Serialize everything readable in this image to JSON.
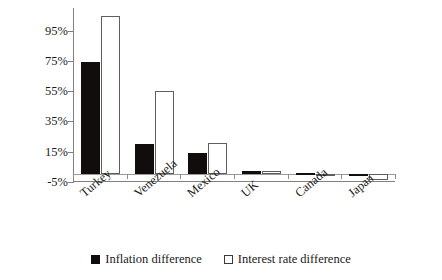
{
  "chart_data": {
    "type": "bar",
    "title": "",
    "subtitle": "",
    "xlabel": "",
    "ylabel": "",
    "categories": [
      "Turkey",
      "Venezuela",
      "Mexico",
      "UK",
      "Canada",
      "Japan"
    ],
    "series": [
      {
        "name": "Inflation difference",
        "swatch": "filled-black-square",
        "color": "#120d0d",
        "values": [
          74,
          20,
          14,
          2,
          1,
          0.5
        ]
      },
      {
        "name": "Interest rate difference",
        "swatch": "hollow-white-square",
        "color": "#ffffff",
        "values": [
          105,
          55,
          21,
          2,
          0.5,
          -4
        ]
      }
    ],
    "ytick_labels": [
      "95%",
      "75%",
      "55%",
      "35%",
      "15%",
      "-5%"
    ],
    "ytick_values": [
      95,
      75,
      55,
      35,
      15,
      -5
    ],
    "ylim": [
      -5,
      110
    ],
    "grid": false,
    "legend_position": "bottom",
    "xlabel_rotation": -40
  },
  "legend": {
    "items": [
      {
        "label": "Inflation difference"
      },
      {
        "label": "Interest rate difference"
      }
    ]
  }
}
